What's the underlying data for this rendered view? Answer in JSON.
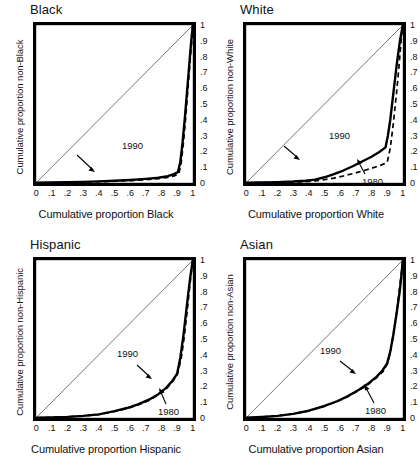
{
  "figure": {
    "layout": "2x2 grid of Lorenz-style cumulative distribution plots",
    "panel_order": [
      "black",
      "white",
      "hispanic",
      "asian"
    ]
  },
  "chart_data": [
    {
      "type": "line",
      "title": "Black",
      "xlabel": "Cumulative proportion Black",
      "ylabel": "Cumulative proportion non-Black",
      "xlim": [
        0,
        1
      ],
      "ylim": [
        0,
        1
      ],
      "xticks": [
        "0",
        ".1",
        ".2",
        ".3",
        ".4",
        ".5",
        ".6",
        ".7",
        ".8",
        ".9",
        "1"
      ],
      "yticks": [
        "0",
        ".1",
        ".2",
        ".3",
        ".4",
        ".5",
        ".6",
        ".7",
        ".8",
        ".9",
        "1"
      ],
      "grid": false,
      "legend": "inline annotations",
      "annotations": [
        {
          "label": "1990",
          "x": 0.63,
          "y": 0.17
        },
        {
          "label": "1980",
          "x": 0.8,
          "y": 0.025
        }
      ],
      "series": [
        {
          "name": "1990",
          "style": "solid",
          "x": [
            0,
            0.1,
            0.2,
            0.3,
            0.4,
            0.5,
            0.6,
            0.7,
            0.78,
            0.84,
            0.88,
            0.905,
            0.92,
            0.935,
            0.95,
            0.965,
            0.98,
            0.99,
            1.0
          ],
          "y": [
            0,
            0.002,
            0.004,
            0.006,
            0.009,
            0.013,
            0.018,
            0.025,
            0.032,
            0.042,
            0.055,
            0.068,
            0.13,
            0.26,
            0.42,
            0.6,
            0.78,
            0.9,
            1.0
          ]
        },
        {
          "name": "1980",
          "style": "dashed",
          "x": [
            0,
            0.1,
            0.2,
            0.3,
            0.4,
            0.5,
            0.6,
            0.7,
            0.78,
            0.84,
            0.88,
            0.91,
            0.925,
            0.94,
            0.955,
            0.97,
            0.985,
            0.995,
            1.0
          ],
          "y": [
            0,
            0.001,
            0.003,
            0.005,
            0.007,
            0.01,
            0.014,
            0.02,
            0.026,
            0.034,
            0.044,
            0.055,
            0.12,
            0.25,
            0.42,
            0.61,
            0.8,
            0.92,
            1.0
          ]
        },
        {
          "name": "diagonal",
          "style": "thin-reference",
          "x": [
            0,
            1
          ],
          "y": [
            0,
            1
          ]
        }
      ]
    },
    {
      "type": "line",
      "title": "White",
      "xlabel": "Cumulative proportion White",
      "ylabel": "Cumulative proportion non-White",
      "xlim": [
        0,
        1
      ],
      "ylim": [
        0,
        1
      ],
      "xticks": [
        "0",
        ".1",
        ".2",
        ".3",
        ".4",
        ".5",
        ".6",
        ".7",
        ".8",
        ".9",
        "1"
      ],
      "yticks": [
        "0",
        ".1",
        ".2",
        ".3",
        ".4",
        ".5",
        ".6",
        ".7",
        ".8",
        ".9",
        "1"
      ],
      "grid": false,
      "legend": "inline annotations",
      "annotations": [
        {
          "label": "1990",
          "x": 0.62,
          "y": 0.205
        },
        {
          "label": "1980",
          "x": 0.89,
          "y": 0.02
        }
      ],
      "series": [
        {
          "name": "1990",
          "style": "solid",
          "x": [
            0,
            0.1,
            0.2,
            0.3,
            0.38,
            0.44,
            0.5,
            0.56,
            0.62,
            0.68,
            0.74,
            0.8,
            0.85,
            0.89,
            0.905,
            0.92,
            0.94,
            0.96,
            0.98,
            1.0
          ],
          "y": [
            0,
            0.002,
            0.004,
            0.008,
            0.013,
            0.02,
            0.035,
            0.055,
            0.078,
            0.105,
            0.135,
            0.165,
            0.195,
            0.225,
            0.3,
            0.4,
            0.57,
            0.74,
            0.89,
            1.0
          ]
        },
        {
          "name": "1980",
          "style": "dashed",
          "x": [
            0,
            0.1,
            0.2,
            0.3,
            0.38,
            0.44,
            0.5,
            0.56,
            0.62,
            0.68,
            0.74,
            0.8,
            0.86,
            0.9,
            0.92,
            0.94,
            0.96,
            0.975,
            0.99,
            1.0
          ],
          "y": [
            0,
            0.001,
            0.002,
            0.004,
            0.007,
            0.012,
            0.02,
            0.03,
            0.043,
            0.058,
            0.074,
            0.092,
            0.112,
            0.128,
            0.22,
            0.38,
            0.57,
            0.73,
            0.91,
            1.0
          ]
        },
        {
          "name": "diagonal",
          "style": "thin-reference",
          "x": [
            0,
            1
          ],
          "y": [
            0,
            1
          ]
        }
      ]
    },
    {
      "type": "line",
      "title": "Hispanic",
      "xlabel": "Cumulative proportion Hispanic",
      "ylabel": "Cumulative proportion non-Hispanic",
      "xlim": [
        0,
        1
      ],
      "ylim": [
        0,
        1
      ],
      "xticks": [
        "0",
        ".1",
        ".2",
        ".3",
        ".4",
        ".5",
        ".6",
        ".7",
        ".8",
        ".9",
        "1"
      ],
      "yticks": [
        "0",
        ".1",
        ".2",
        ".3",
        ".4",
        ".5",
        ".6",
        ".7",
        ".8",
        ".9",
        "1"
      ],
      "grid": false,
      "legend": "inline annotations",
      "annotations": [
        {
          "label": "1990",
          "x": 0.63,
          "y": 0.3
        },
        {
          "label": "1980",
          "x": 0.8,
          "y": 0.095
        }
      ],
      "series": [
        {
          "name": "1990",
          "style": "solid",
          "x": [
            0,
            0.1,
            0.2,
            0.3,
            0.4,
            0.5,
            0.58,
            0.65,
            0.72,
            0.78,
            0.83,
            0.87,
            0.9,
            0.92,
            0.94,
            0.955,
            0.97,
            0.985,
            1.0
          ],
          "y": [
            0,
            0.003,
            0.006,
            0.012,
            0.022,
            0.042,
            0.062,
            0.085,
            0.115,
            0.15,
            0.19,
            0.235,
            0.28,
            0.38,
            0.52,
            0.65,
            0.78,
            0.9,
            1.0
          ]
        },
        {
          "name": "1980",
          "style": "dashed",
          "x": [
            0,
            0.1,
            0.2,
            0.3,
            0.4,
            0.5,
            0.58,
            0.65,
            0.72,
            0.78,
            0.83,
            0.87,
            0.9,
            0.925,
            0.945,
            0.96,
            0.975,
            0.99,
            1.0
          ],
          "y": [
            0,
            0.003,
            0.006,
            0.011,
            0.021,
            0.04,
            0.059,
            0.081,
            0.11,
            0.145,
            0.184,
            0.228,
            0.272,
            0.37,
            0.51,
            0.64,
            0.78,
            0.92,
            1.0
          ]
        },
        {
          "name": "diagonal",
          "style": "thin-reference",
          "x": [
            0,
            1
          ],
          "y": [
            0,
            1
          ]
        }
      ]
    },
    {
      "type": "line",
      "title": "Asian",
      "xlabel": "Cumulative proportion Asian",
      "ylabel": "Cumulative proportion non-Asian",
      "xlim": [
        0,
        1
      ],
      "ylim": [
        0,
        1
      ],
      "xticks": [
        "0",
        ".1",
        ".2",
        ".3",
        ".4",
        ".5",
        ".6",
        ".7",
        ".8",
        ".9",
        "1"
      ],
      "yticks": [
        "0",
        ".1",
        ".2",
        ".3",
        ".4",
        ".5",
        ".6",
        ".7",
        ".8",
        ".9",
        "1"
      ],
      "grid": false,
      "legend": "inline annotations",
      "annotations": [
        {
          "label": "1990",
          "x": 0.6,
          "y": 0.325
        },
        {
          "label": "1980",
          "x": 0.84,
          "y": 0.105
        }
      ],
      "series": [
        {
          "name": "1990",
          "style": "solid",
          "x": [
            0,
            0.1,
            0.2,
            0.3,
            0.4,
            0.5,
            0.58,
            0.65,
            0.72,
            0.78,
            0.83,
            0.87,
            0.9,
            0.92,
            0.94,
            0.96,
            0.98,
            0.99,
            1.0
          ],
          "y": [
            0,
            0.005,
            0.012,
            0.025,
            0.045,
            0.075,
            0.105,
            0.138,
            0.178,
            0.218,
            0.258,
            0.3,
            0.345,
            0.42,
            0.53,
            0.66,
            0.8,
            0.89,
            1.0
          ]
        },
        {
          "name": "1980",
          "style": "dashed",
          "x": [
            0,
            0.1,
            0.2,
            0.3,
            0.4,
            0.5,
            0.58,
            0.65,
            0.72,
            0.78,
            0.83,
            0.875,
            0.905,
            0.925,
            0.945,
            0.965,
            0.98,
            0.99,
            1.0
          ],
          "y": [
            0,
            0.005,
            0.012,
            0.025,
            0.045,
            0.074,
            0.103,
            0.135,
            0.174,
            0.213,
            0.252,
            0.295,
            0.35,
            0.44,
            0.56,
            0.7,
            0.83,
            0.91,
            1.0
          ]
        },
        {
          "name": "diagonal",
          "style": "thin-reference",
          "x": [
            0,
            1
          ],
          "y": [
            0,
            1
          ]
        }
      ]
    }
  ]
}
